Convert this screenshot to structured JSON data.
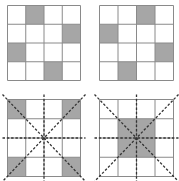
{
  "figure": {
    "colors": {
      "background": "#ffffff",
      "grid_line": "#8a8a8a",
      "shade": "#a6a6a6",
      "dashed_line": "#333333"
    },
    "grid_size": 4,
    "panels": [
      {
        "id": "top-left",
        "shaded": [
          [
            0,
            1
          ],
          [
            1,
            3
          ],
          [
            2,
            0
          ],
          [
            3,
            2
          ]
        ],
        "symmetry_lines": false
      },
      {
        "id": "top-right",
        "shaded": [
          [
            0,
            2
          ],
          [
            1,
            0
          ],
          [
            2,
            3
          ],
          [
            3,
            1
          ]
        ],
        "symmetry_lines": false
      },
      {
        "id": "bottom-left",
        "shaded": [
          [
            0,
            0
          ],
          [
            0,
            3
          ],
          [
            3,
            0
          ],
          [
            3,
            3
          ]
        ],
        "symmetry_lines": true
      },
      {
        "id": "bottom-right",
        "shaded": [
          [
            1,
            1
          ],
          [
            1,
            2
          ],
          [
            2,
            1
          ],
          [
            2,
            2
          ]
        ],
        "symmetry_lines": true
      }
    ]
  }
}
